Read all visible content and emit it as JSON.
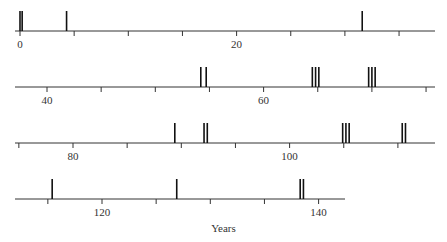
{
  "chart_data": {
    "type": "timeline",
    "title": "",
    "xlabel": "Years",
    "ylabel": "",
    "grid": false,
    "tick_interval": 5,
    "labeled_ticks": [
      0,
      20,
      40,
      60,
      80,
      100,
      120,
      140
    ],
    "rows": [
      {
        "range": [
          -0.5,
          38.5
        ],
        "labels": [
          {
            "value": 0,
            "text": "0"
          },
          {
            "value": 20,
            "text": "20"
          }
        ],
        "ticks": [
          0,
          5,
          10,
          15,
          20,
          25,
          30,
          35
        ],
        "events": [
          0.0,
          0.2,
          4.3,
          31.6
        ]
      },
      {
        "range": [
          37.0,
          76.0
        ],
        "labels": [
          {
            "value": 40,
            "text": "40"
          },
          {
            "value": 60,
            "text": "60"
          }
        ],
        "ticks": [
          40,
          45,
          50,
          55,
          60,
          65,
          70,
          75
        ],
        "events": [
          54.2,
          54.7,
          64.5,
          64.8,
          65.1,
          69.7,
          70.0,
          70.3
        ]
      },
      {
        "range": [
          74.6,
          113.6
        ],
        "labels": [
          {
            "value": 80,
            "text": "80"
          },
          {
            "value": 100,
            "text": "100"
          }
        ],
        "ticks": [
          75,
          80,
          85,
          90,
          95,
          100,
          105,
          110
        ],
        "events": [
          89.4,
          92.1,
          92.4,
          104.9,
          105.2,
          105.5,
          110.4,
          110.7
        ]
      },
      {
        "range": [
          112.1,
          142.6
        ],
        "labels": [
          {
            "value": 120,
            "text": "120"
          },
          {
            "value": 140,
            "text": "140"
          }
        ],
        "ticks": [
          115,
          120,
          125,
          130,
          135,
          140
        ],
        "events": [
          115.4,
          126.9,
          138.3,
          138.6
        ]
      }
    ]
  },
  "layout": {
    "px_per_year": 10.83,
    "rows": [
      {
        "axis_y": 31,
        "x_start": 15,
        "x_end": 435,
        "origin_value": 0,
        "origin_x": 20
      },
      {
        "axis_y": 87,
        "x_start": 15,
        "x_end": 435,
        "origin_value": 40,
        "origin_x": 47
      },
      {
        "axis_y": 143,
        "x_start": 15,
        "x_end": 435,
        "origin_value": 80,
        "origin_x": 73
      },
      {
        "axis_y": 199,
        "x_start": 15,
        "x_end": 345,
        "origin_value": 120,
        "origin_x": 102
      }
    ],
    "event_height": 20,
    "tick_length": 5
  },
  "colors": {
    "axis": "#333333",
    "event": "#111111",
    "background": "#ffffff"
  }
}
